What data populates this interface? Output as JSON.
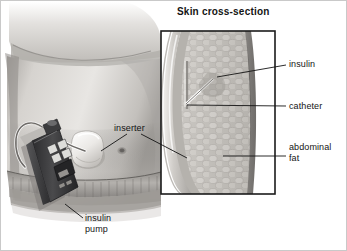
{
  "figure": {
    "kind": "medical-illustration",
    "frame_color": "#c9c9c9",
    "background_color": "#ffffff",
    "ink_color": "#141414"
  },
  "inset": {
    "title": "Skin cross-section",
    "border_color": "#1b1b1b"
  },
  "labels": {
    "insulin": "insulin",
    "catheter": "catheter",
    "abdominal_fat": "abdominal\nfat",
    "inserter": "inserter",
    "insulin_pump": "insulin\npump"
  },
  "icons": {
    "pump_device": "insulin-pump-icon",
    "inserter_patch": "inserter-patch-icon",
    "catheter_needle": "catheter-needle-icon",
    "tubing": "tubing-icon"
  },
  "palette": {
    "skin_light": "#e6e4e1",
    "skin_mid": "#c8c5c1",
    "skin_shadow": "#9a9894",
    "skin_deep": "#6f6d6a",
    "pump_body": "#3a3a3c",
    "pump_button": "#d8d8d6",
    "fat_tissue": "#b9b6b1",
    "dermis": "#8e8b87"
  }
}
